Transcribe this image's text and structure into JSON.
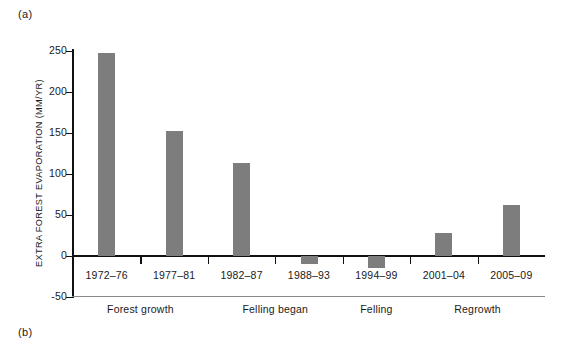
{
  "figure": {
    "panel_a_label": "(a)",
    "panel_b_label": "(b)"
  },
  "chart_data": {
    "type": "bar",
    "title": "",
    "xlabel": "",
    "ylabel": "EXTRA FOREST EVAPORATION (MM/YR)",
    "categories": [
      "1972–76",
      "1977–81",
      "1982–87",
      "1988–93",
      "1994–99",
      "2001–04",
      "2005–09"
    ],
    "values": [
      247,
      153,
      113,
      -10,
      -15,
      28,
      62
    ],
    "ylim": [
      -50,
      250
    ],
    "yticks": [
      -50,
      0,
      50,
      100,
      150,
      200,
      250
    ],
    "ytick_labels": [
      "-50",
      "0",
      "50",
      "100",
      "150",
      "200",
      "250"
    ],
    "grid": false,
    "legend": null,
    "bar_color": "#7d7d7d",
    "axis_color": "#111111",
    "annotations": [
      {
        "label": "Forest growth",
        "spans": [
          "1972–76",
          "1977–81"
        ]
      },
      {
        "label": "Felling began",
        "spans": [
          "1982–87",
          "1988–93"
        ]
      },
      {
        "label": "Felling",
        "spans": [
          "1994–99"
        ]
      },
      {
        "label": "Regrowth",
        "spans": [
          "2001–04",
          "2005–09"
        ]
      }
    ]
  }
}
